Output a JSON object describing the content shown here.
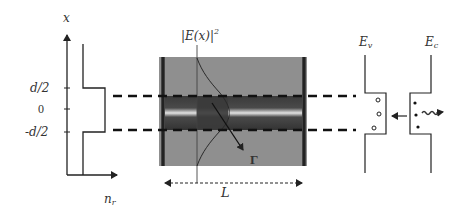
{
  "index_profile_panel": {
    "axis_y_label": "x",
    "axis_x_label": "n",
    "axis_x_label_subscript": "r",
    "ticks": [
      {
        "label": "d/2",
        "y": 88
      },
      {
        "label": "0",
        "y": 109
      },
      {
        "label": "-d/2",
        "y": 132
      }
    ]
  },
  "waveguide_panel": {
    "field_label": "|E(x)|",
    "field_label_exponent": "2",
    "confinement_label": "Γ",
    "length_label": "L",
    "colors": {
      "cladding": "#8f8f8f",
      "core": "#3c3c3c",
      "core_stripe": "#e2e2e2",
      "mirror": "#1a1a1a"
    }
  },
  "band_panel": {
    "valence_label": "E",
    "valence_subscript": "v",
    "conduction_label": "E",
    "conduction_subscript": "c",
    "holes_count": 3,
    "electrons_count": 3
  },
  "colors": {
    "line": "#222222",
    "text": "#333333",
    "background": "#ffffff"
  }
}
